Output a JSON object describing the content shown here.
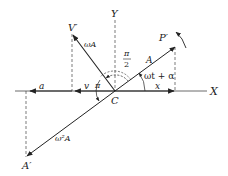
{
  "diagram": {
    "title": "",
    "labels": {
      "x_axis": "X",
      "y_axis": "Y",
      "origin": "C",
      "p_prime": "P′",
      "v_prime": "V′",
      "a_prime": "A′",
      "amplitude": "A",
      "velocity_amp": "ωA",
      "accel_amp": "ω²A",
      "phase": "ωt + α",
      "pi_half_num": "π",
      "pi_half_den": "2",
      "pi": "π",
      "x": "x",
      "v": "v",
      "a": "a"
    },
    "colors": {
      "line": "#222222",
      "dashed": "#444444",
      "background": "#ffffff"
    }
  }
}
